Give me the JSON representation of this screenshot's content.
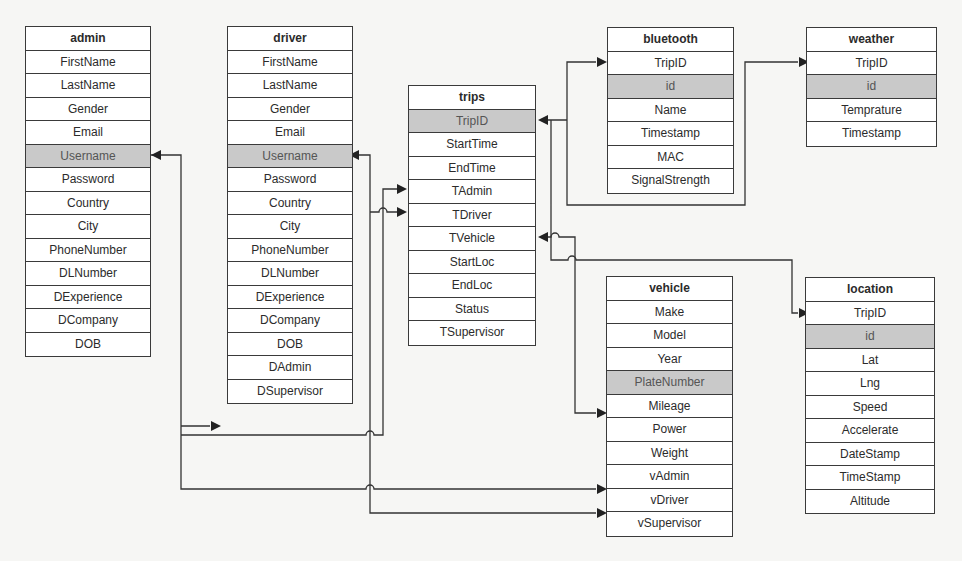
{
  "diagram": {
    "type": "entity-relationship",
    "colors": {
      "primary_key_fill": "#c9c9c9",
      "border": "#3a3a3a",
      "background": "#f6f6f4"
    },
    "tables": {
      "admin": {
        "name": "admin",
        "primary_key": "Username",
        "fields": [
          "FirstName",
          "LastName",
          "Gender",
          "Email",
          "Username",
          "Password",
          "Country",
          "City",
          "PhoneNumber",
          "DLNumber",
          "DExperience",
          "DCompany",
          "DOB"
        ]
      },
      "driver": {
        "name": "driver",
        "primary_key": "Username",
        "fields": [
          "FirstName",
          "LastName",
          "Gender",
          "Email",
          "Username",
          "Password",
          "Country",
          "City",
          "PhoneNumber",
          "DLNumber",
          "DExperience",
          "DCompany",
          "DOB",
          "DAdmin",
          "DSupervisor"
        ]
      },
      "trips": {
        "name": "trips",
        "primary_key": "TripID",
        "fields": [
          "TripID",
          "StartTime",
          "EndTime",
          "TAdmin",
          "TDriver",
          "TVehicle",
          "StartLoc",
          "EndLoc",
          "Status",
          "TSupervisor"
        ]
      },
      "bluetooth": {
        "name": "bluetooth",
        "primary_key": "id",
        "fields": [
          "TripID",
          "id",
          "Name",
          "Timestamp",
          "MAC",
          "SignalStrength"
        ]
      },
      "weather": {
        "name": "weather",
        "primary_key": "id",
        "fields": [
          "TripID",
          "id",
          "Temprature",
          "Timestamp"
        ]
      },
      "vehicle": {
        "name": "vehicle",
        "primary_key": "PlateNumber",
        "fields": [
          "Make",
          "Model",
          "Year",
          "PlateNumber",
          "Mileage",
          "Power",
          "Weight",
          "vAdmin",
          "vDriver",
          "vSupervisor"
        ]
      },
      "location": {
        "name": "location",
        "primary_key": "id",
        "fields": [
          "TripID",
          "id",
          "Lat",
          "Lng",
          "Speed",
          "Accelerate",
          "DateStamp",
          "TimeStamp",
          "Altitude"
        ]
      }
    },
    "relationships": [
      {
        "from": "driver.DAdmin",
        "to": "admin.Username"
      },
      {
        "from": "trips.TAdmin",
        "to": "admin.Username"
      },
      {
        "from": "vehicle.vAdmin",
        "to": "admin.Username"
      },
      {
        "from": "trips.TDriver",
        "to": "driver.Username"
      },
      {
        "from": "vehicle.vDriver",
        "to": "driver.Username"
      },
      {
        "from": "bluetooth.TripID",
        "to": "trips.TripID"
      },
      {
        "from": "weather.TripID",
        "to": "trips.TripID"
      },
      {
        "from": "location.TripID",
        "to": "trips.TripID"
      },
      {
        "from": "trips.TVehicle",
        "to": "vehicle.PlateNumber"
      }
    ]
  }
}
